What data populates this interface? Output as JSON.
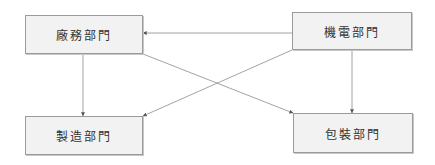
{
  "diagram": {
    "type": "flowchart",
    "nodes": [
      {
        "id": "facility",
        "label": "廠務部門"
      },
      {
        "id": "mech",
        "label": "機電部門"
      },
      {
        "id": "mfg",
        "label": "製造部門"
      },
      {
        "id": "pack",
        "label": "包裝部門"
      }
    ],
    "edges": [
      {
        "from": "mech",
        "to": "facility"
      },
      {
        "from": "facility",
        "to": "mfg"
      },
      {
        "from": "facility",
        "to": "pack"
      },
      {
        "from": "mech",
        "to": "mfg"
      },
      {
        "from": "mech",
        "to": "pack"
      }
    ],
    "colors": {
      "node_fill": "#f2f2f2",
      "node_border": "#9a9a9a",
      "edge": "#8c8c8c",
      "text": "#333333"
    }
  }
}
